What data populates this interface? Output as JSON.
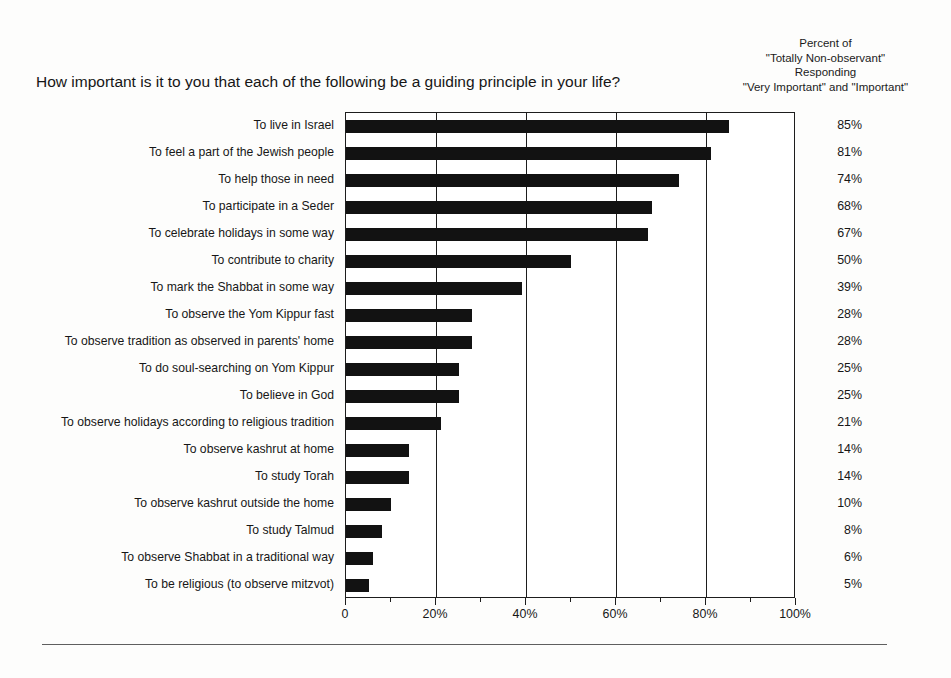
{
  "header": {
    "question": "How important is it to you that each of the following be a guiding principle in your life?",
    "right_block": [
      "Percent of",
      "\"Totally Non-observant\"",
      "Responding",
      "\"Very Important\" and \"Important\""
    ]
  },
  "chart_data": {
    "type": "bar",
    "orientation": "horizontal",
    "title": "How important is it to you that each of the following be a guiding principle in your life?",
    "xlabel": "",
    "ylabel": "",
    "xlim": [
      0,
      100
    ],
    "grid": true,
    "legend": false,
    "bar_color": "#121212",
    "axis_color": "#1d1d1d",
    "categories": [
      "To live in Israel",
      "To feel a part of the Jewish people",
      "To help those in need",
      "To participate in a  Seder",
      "To celebrate holidays in some way",
      "To contribute to charity",
      "To mark the Shabbat in some way",
      "To observe the Yom Kippur fast",
      "To observe tradition as observed in parents' home",
      "To do soul-searching on Yom Kippur",
      "To believe in God",
      "To observe holidays according to religious tradition",
      "To observe kashrut at home",
      "To study Torah",
      "To observe kashrut outside the home",
      "To study Talmud",
      "To observe Shabbat in a traditional way",
      "To be religious (to observe mitzvot)"
    ],
    "values": [
      85,
      81,
      74,
      68,
      67,
      50,
      39,
      28,
      28,
      25,
      25,
      21,
      14,
      14,
      10,
      8,
      6,
      5
    ],
    "value_labels": [
      "85%",
      "81%",
      "74%",
      "68%",
      "67%",
      "50%",
      "39%",
      "28%",
      "28%",
      "25%",
      "25%",
      "21%",
      "14%",
      "14%",
      "10%",
      "8%",
      "6%",
      "5%"
    ],
    "xticks": [
      0,
      20,
      40,
      60,
      80,
      100
    ],
    "xtick_labels": [
      "0",
      "20%",
      "40%",
      "60%",
      "80%",
      "100%"
    ],
    "x_minor_ticks": [
      10,
      30,
      50,
      70,
      90
    ],
    "gridlines": [
      20,
      40,
      60,
      80
    ]
  }
}
